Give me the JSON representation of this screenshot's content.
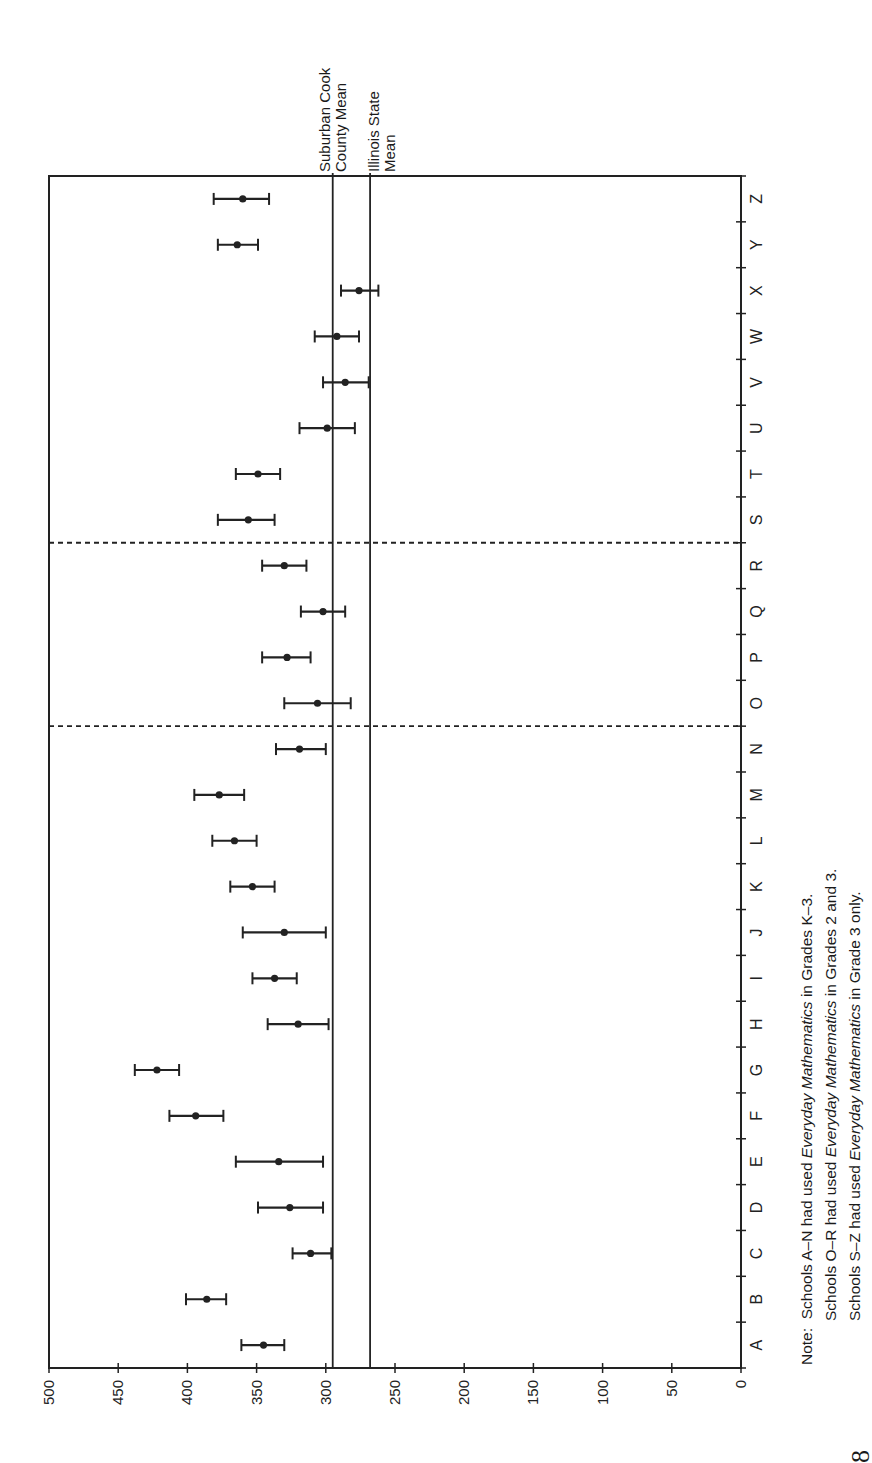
{
  "chart_data": {
    "type": "scatter",
    "orientation": "rotated-90-ccw",
    "title": "",
    "xlabel": "School",
    "ylabel": "Score",
    "ylim": [
      0,
      500
    ],
    "yticks": [
      0,
      50,
      100,
      150,
      200,
      250,
      300,
      350,
      400,
      450,
      500
    ],
    "categories": [
      "A",
      "B",
      "C",
      "D",
      "E",
      "F",
      "G",
      "H",
      "I",
      "J",
      "K",
      "L",
      "M",
      "N",
      "O",
      "P",
      "Q",
      "R",
      "S",
      "T",
      "U",
      "V",
      "W",
      "X",
      "Y",
      "Z"
    ],
    "series": [
      {
        "name": "School mean with error bars",
        "values": [
          345,
          386,
          311,
          326,
          334,
          394,
          422,
          320,
          337,
          330,
          353,
          366,
          377,
          319,
          306,
          328,
          302,
          330,
          356,
          349,
          299,
          286,
          292,
          276,
          364,
          360
        ],
        "lower": [
          330,
          372,
          296,
          302,
          302,
          374,
          406,
          298,
          321,
          300,
          337,
          350,
          359,
          300,
          282,
          311,
          286,
          314,
          337,
          333,
          279,
          269,
          276,
          262,
          349,
          341
        ],
        "upper": [
          361,
          401,
          324,
          349,
          365,
          413,
          438,
          342,
          353,
          360,
          369,
          382,
          395,
          336,
          330,
          346,
          318,
          346,
          378,
          365,
          319,
          302,
          308,
          289,
          378,
          381
        ]
      }
    ],
    "reference_lines": [
      {
        "label": "Suburban Cook County Mean",
        "value": 295
      },
      {
        "label": "Illinois State Mean",
        "value": 268
      }
    ],
    "group_dividers_after": [
      "N",
      "R"
    ],
    "grid": false,
    "legend": "none"
  },
  "labels": {
    "cook_line1": "Suburban Cook",
    "cook_line2": "County Mean",
    "state_line1": "Illinois State",
    "state_line2": "Mean"
  },
  "note": {
    "prefix": "Note:",
    "lines": [
      {
        "pre": "Schools A–N had used ",
        "italic": "Everyday Mathematics",
        "post": " in Grades K–3."
      },
      {
        "pre": "Schools O–R had used ",
        "italic": "Everyday Mathematics",
        "post": " in Grades 2 and 3."
      },
      {
        "pre": "Schools S–Z had used ",
        "italic": "Everyday Mathematics",
        "post": " in Grade 3 only."
      }
    ]
  },
  "page_number": "8"
}
